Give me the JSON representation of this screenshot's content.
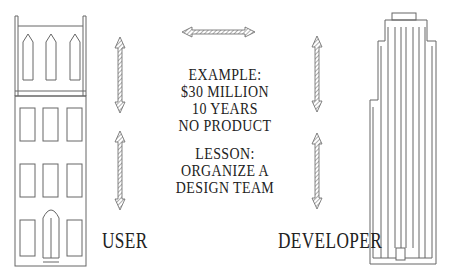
{
  "diagram": {
    "type": "user-developer relationship illustration",
    "left_building": {
      "label": "USER",
      "style": "brownstone townhouse"
    },
    "right_building": {
      "label": "DEVELOPER",
      "style": "skyscraper"
    },
    "example": {
      "heading": "EXAMPLE:",
      "lines": [
        "$30 MILLION",
        "10 YEARS",
        "NO PRODUCT"
      ]
    },
    "lesson": {
      "heading": "LESSON:",
      "lines": [
        "ORGANIZE A",
        "DESIGN TEAM"
      ]
    },
    "arrows": [
      {
        "id": "top-horizontal",
        "direction": "bidirectional-horizontal"
      },
      {
        "id": "left-upper",
        "direction": "bidirectional-vertical"
      },
      {
        "id": "left-lower",
        "direction": "bidirectional-vertical"
      },
      {
        "id": "right-upper",
        "direction": "bidirectional-vertical"
      },
      {
        "id": "right-lower",
        "direction": "bidirectional-vertical"
      }
    ],
    "colors": {
      "line": "#555555",
      "text": "#222222",
      "background": "#ffffff"
    }
  }
}
